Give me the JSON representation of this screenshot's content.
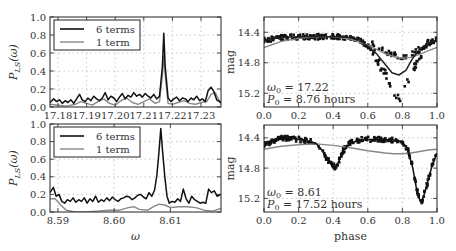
{
  "chart_data": [
    {
      "id": "top-left",
      "type": "line",
      "title": "",
      "xlabel": "",
      "ylabel": "P_LS(ω)",
      "xlim": [
        17.1772,
        17.237
      ],
      "ylim": [
        0.0,
        1.0
      ],
      "xticks": [
        17.18,
        17.19,
        17.2,
        17.21,
        17.22,
        17.23
      ],
      "xtick_labels": [
        "17.18",
        "17.19",
        "17.20",
        "17.21",
        "17.22",
        "17.23"
      ],
      "yticks": [
        0.0,
        0.2,
        0.4,
        0.6,
        0.8,
        1.0
      ],
      "ytick_labels": [
        "0.0",
        "0.2",
        "0.4",
        "0.6",
        "0.8",
        "1.0"
      ],
      "grid": true,
      "legend": {
        "position": "upper left",
        "entries": [
          "6 terms",
          "1 term"
        ]
      },
      "series": [
        {
          "name": "6 terms",
          "color": "#111111",
          "x": [
            17.1772,
            17.1785,
            17.1795,
            17.1805,
            17.1815,
            17.1825,
            17.1835,
            17.1845,
            17.1855,
            17.1865,
            17.1875,
            17.1885,
            17.1895,
            17.1905,
            17.1915,
            17.1925,
            17.1935,
            17.1945,
            17.1955,
            17.1965,
            17.1975,
            17.1985,
            17.1995,
            17.2005,
            17.2015,
            17.2025,
            17.2035,
            17.2045,
            17.2055,
            17.2065,
            17.2075,
            17.2085,
            17.2095,
            17.2105,
            17.2115,
            17.2125,
            17.2135,
            17.2145,
            17.2155,
            17.2165,
            17.217,
            17.2175,
            17.2185,
            17.2195,
            17.2205,
            17.2215,
            17.2225,
            17.2235,
            17.2245,
            17.2255,
            17.2265,
            17.2275,
            17.2285,
            17.2295,
            17.2305,
            17.2315,
            17.2325,
            17.2335,
            17.2345,
            17.2355,
            17.237
          ],
          "y": [
            0.05,
            0.09,
            0.06,
            0.08,
            0.04,
            0.07,
            0.05,
            0.08,
            0.04,
            0.09,
            0.14,
            0.08,
            0.06,
            0.1,
            0.07,
            0.12,
            0.09,
            0.07,
            0.1,
            0.16,
            0.08,
            0.12,
            0.1,
            0.06,
            0.11,
            0.15,
            0.09,
            0.13,
            0.11,
            0.16,
            0.12,
            0.14,
            0.11,
            0.15,
            0.12,
            0.1,
            0.14,
            0.09,
            0.12,
            0.45,
            0.82,
            0.45,
            0.1,
            0.06,
            0.09,
            0.11,
            0.07,
            0.1,
            0.09,
            0.06,
            0.1,
            0.08,
            0.12,
            0.07,
            0.09,
            0.06,
            0.18,
            0.22,
            0.17,
            0.08,
            0.05
          ]
        },
        {
          "name": "1 term",
          "color": "#888888",
          "x": [
            17.1772,
            17.18,
            17.183,
            17.186,
            17.188,
            17.19,
            17.192,
            17.194,
            17.196,
            17.198,
            17.2,
            17.202,
            17.204,
            17.206,
            17.208,
            17.21,
            17.212,
            17.214,
            17.2155,
            17.2165,
            17.217,
            17.2175,
            17.2185,
            17.22,
            17.222,
            17.224,
            17.226,
            17.228,
            17.23,
            17.232,
            17.2335,
            17.235,
            17.237
          ],
          "y": [
            0.03,
            0.02,
            0.01,
            0.03,
            0.06,
            0.04,
            0.02,
            0.06,
            0.09,
            0.04,
            0.02,
            0.07,
            0.1,
            0.05,
            0.03,
            0.06,
            0.09,
            0.04,
            0.06,
            0.35,
            0.57,
            0.35,
            0.04,
            0.03,
            0.05,
            0.07,
            0.04,
            0.03,
            0.05,
            0.06,
            0.14,
            0.16,
            0.03
          ]
        }
      ]
    },
    {
      "id": "top-right",
      "type": "scatter",
      "xlabel": "",
      "ylabel": "mag",
      "xlim": [
        0.0,
        1.0
      ],
      "ylim": [
        15.38,
        14.2
      ],
      "xticks": [
        0.0,
        0.2,
        0.4,
        0.6,
        0.8,
        1.0
      ],
      "xtick_labels": [
        "0.0",
        "0.2",
        "0.4",
        "0.6",
        "0.8",
        "1.0"
      ],
      "yticks": [
        14.4,
        14.8,
        15.2
      ],
      "ytick_labels": [
        "14.4",
        "14.8",
        "15.2"
      ],
      "grid": true,
      "annotation": [
        "ω0 = 17.22",
        "P0 = 8.76 hours"
      ],
      "annotation_omega_label": "ω",
      "annotation_omega_value": "0 = 17.22",
      "annotation_period_label": "P",
      "annotation_period_value": "0 = 8.76 hours",
      "points_description": "Two-branch light curve: flat ~14.45–14.5 from phase 0 to 0.55, then a branch dipping to ~15.3 near phase 0.78 and a shallower branch to ~14.75 near 0.8, recovering to ~14.5 by 1.0",
      "series": [
        {
          "name": "6-term model",
          "color": "#222222",
          "x": [
            0.0,
            0.1,
            0.2,
            0.3,
            0.4,
            0.5,
            0.55,
            0.6,
            0.65,
            0.7,
            0.74,
            0.78,
            0.82,
            0.86,
            0.9,
            0.95,
            1.0
          ],
          "y": [
            14.5,
            14.47,
            14.46,
            14.46,
            14.46,
            14.47,
            14.5,
            14.58,
            14.68,
            14.82,
            14.93,
            14.96,
            14.9,
            14.74,
            14.62,
            14.54,
            14.5
          ]
        },
        {
          "name": "1-term model",
          "color": "#888888",
          "x": [
            0.0,
            0.1,
            0.2,
            0.3,
            0.4,
            0.5,
            0.6,
            0.7,
            0.75,
            0.8,
            0.85,
            0.9,
            0.95,
            1.0
          ],
          "y": [
            14.6,
            14.52,
            14.48,
            14.46,
            14.46,
            14.49,
            14.57,
            14.68,
            14.72,
            14.74,
            14.73,
            14.69,
            14.64,
            14.6
          ]
        }
      ]
    },
    {
      "id": "bottom-left",
      "type": "line",
      "xlabel": "ω",
      "ylabel": "P_LS(ω)",
      "xlim": [
        8.5886,
        8.619
      ],
      "ylim": [
        0.0,
        1.0
      ],
      "xticks": [
        8.59,
        8.6,
        8.61
      ],
      "xtick_labels": [
        "8.59",
        "8.60",
        "8.61"
      ],
      "yticks": [
        0.0,
        0.2,
        0.4,
        0.6,
        0.8,
        1.0
      ],
      "ytick_labels": [
        "0.0",
        "0.2",
        "0.4",
        "0.6",
        "0.8",
        "1.0"
      ],
      "grid": true,
      "legend": {
        "position": "upper left",
        "entries": [
          "6 terms",
          "1 term"
        ]
      },
      "series": [
        {
          "name": "6 terms",
          "color": "#111111",
          "x": [
            8.5886,
            8.5892,
            8.5897,
            8.5902,
            8.5907,
            8.5912,
            8.5917,
            8.5922,
            8.5927,
            8.5932,
            8.5937,
            8.5942,
            8.5947,
            8.5952,
            8.5957,
            8.5962,
            8.5967,
            8.5972,
            8.5977,
            8.5982,
            8.5987,
            8.5992,
            8.5997,
            8.6002,
            8.6007,
            8.6012,
            8.6017,
            8.6022,
            8.6027,
            8.6032,
            8.6037,
            8.6042,
            8.6047,
            8.6052,
            8.6057,
            8.6062,
            8.6067,
            8.6072,
            8.6076,
            8.608,
            8.6083,
            8.6086,
            8.609,
            8.6094,
            8.6098,
            8.6103,
            8.6108,
            8.6113,
            8.6118,
            8.6123,
            8.6128,
            8.6133,
            8.6138,
            8.6143,
            8.6148,
            8.6153,
            8.6158,
            8.6163,
            8.6168,
            8.6173,
            8.6178,
            8.6183,
            8.619
          ],
          "y": [
            0.22,
            0.28,
            0.18,
            0.2,
            0.12,
            0.1,
            0.14,
            0.12,
            0.16,
            0.11,
            0.14,
            0.12,
            0.16,
            0.1,
            0.15,
            0.12,
            0.18,
            0.11,
            0.14,
            0.12,
            0.16,
            0.13,
            0.17,
            0.14,
            0.12,
            0.15,
            0.16,
            0.18,
            0.17,
            0.14,
            0.16,
            0.19,
            0.2,
            0.17,
            0.15,
            0.22,
            0.18,
            0.25,
            0.42,
            0.7,
            0.95,
            0.7,
            0.4,
            0.18,
            0.1,
            0.12,
            0.11,
            0.15,
            0.12,
            0.26,
            0.15,
            0.1,
            0.18,
            0.14,
            0.12,
            0.1,
            0.11,
            0.1,
            0.26,
            0.22,
            0.24,
            0.18,
            0.2
          ]
        },
        {
          "name": "1 term",
          "color": "#888888",
          "x": [
            8.5886,
            8.5895,
            8.5905,
            8.5915,
            8.593,
            8.595,
            8.597,
            8.599,
            8.601,
            8.6025,
            8.6035,
            8.6045,
            8.606,
            8.607,
            8.608,
            8.609,
            8.61,
            8.6115,
            8.613,
            8.6145,
            8.616,
            8.6175,
            8.619
          ],
          "y": [
            0.15,
            0.15,
            0.08,
            0.02,
            0.0,
            0.0,
            0.01,
            0.02,
            0.02,
            0.05,
            0.06,
            0.03,
            0.02,
            0.06,
            0.09,
            0.08,
            0.05,
            0.06,
            0.06,
            0.05,
            0.02,
            0.01,
            0.04
          ]
        }
      ]
    },
    {
      "id": "bottom-right",
      "type": "scatter",
      "xlabel": "phase",
      "ylabel": "mag",
      "xlim": [
        0.0,
        1.0
      ],
      "ylim": [
        15.38,
        14.23
      ],
      "xticks": [
        0.0,
        0.2,
        0.4,
        0.6,
        0.8,
        1.0
      ],
      "xtick_labels": [
        "0.0",
        "0.2",
        "0.4",
        "0.6",
        "0.8",
        "1.0"
      ],
      "yticks": [
        14.4,
        14.8,
        15.2
      ],
      "ytick_labels": [
        "14.4",
        "14.8",
        "15.2"
      ],
      "grid": true,
      "annotation": [
        "ω0 = 8.61",
        "P0 = 17.52 hours"
      ],
      "annotation_omega_label": "ω",
      "annotation_omega_value": "0 = 8.61",
      "annotation_period_label": "P",
      "annotation_period_value": "0 = 17.52 hours",
      "points_description": "Eclipsing-binary light curve: max ~14.4 near phase 0.12, secondary eclipse to ~14.78 at phase 0.41, plateau ~14.42 from 0.5–0.8, primary eclipse to ~15.3 at phase 0.91, back to ~14.5 at 1.0",
      "series": [
        {
          "name": "6-term model",
          "color": "#111111",
          "x": [
            0.0,
            0.05,
            0.1,
            0.15,
            0.2,
            0.25,
            0.3,
            0.33,
            0.36,
            0.39,
            0.41,
            0.43,
            0.46,
            0.5,
            0.55,
            0.6,
            0.65,
            0.7,
            0.75,
            0.8,
            0.83,
            0.86,
            0.88,
            0.9,
            0.91,
            0.93,
            0.95,
            0.97,
            1.0
          ],
          "y": [
            14.5,
            14.44,
            14.41,
            14.4,
            14.42,
            14.44,
            14.47,
            14.55,
            14.66,
            14.76,
            14.78,
            14.72,
            14.56,
            14.47,
            14.43,
            14.42,
            14.42,
            14.42,
            14.43,
            14.45,
            14.55,
            14.8,
            15.05,
            15.22,
            15.25,
            15.12,
            14.95,
            14.78,
            14.6
          ]
        },
        {
          "name": "1-term model",
          "color": "#888888",
          "x": [
            0.0,
            0.1,
            0.2,
            0.3,
            0.4,
            0.5,
            0.6,
            0.7,
            0.75,
            0.8,
            0.85,
            0.9,
            0.95,
            1.0
          ],
          "y": [
            14.55,
            14.51,
            14.49,
            14.48,
            14.5,
            14.53,
            14.57,
            14.6,
            14.61,
            14.61,
            14.6,
            14.58,
            14.56,
            14.55
          ]
        }
      ]
    }
  ]
}
